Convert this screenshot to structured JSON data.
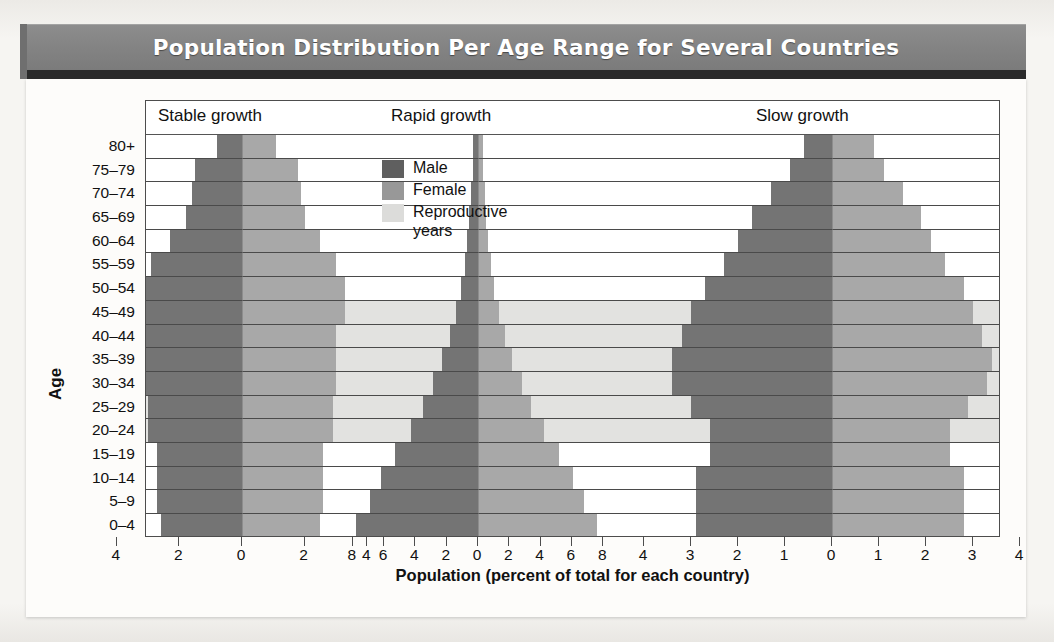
{
  "title": "Population Distribution Per Age Range for Several Countries",
  "axis": {
    "y_title": "Age",
    "x_title": "Population (percent of total for each country)"
  },
  "legend": {
    "items": [
      {
        "key": "male",
        "label": "Male",
        "color": "#5f5f5f"
      },
      {
        "key": "female",
        "label": "Female",
        "color": "#989898"
      },
      {
        "key": "repro",
        "label": "Reproductive\nyears",
        "color": "#dcdcda"
      }
    ]
  },
  "colors": {
    "male": "#747474",
    "female": "#a8a8a8",
    "reproductive_band": "#e2e2e0",
    "title_bar": "#848484",
    "frame": "#4d4d4d"
  },
  "chart_data": {
    "type": "bar",
    "subtype": "population-pyramid",
    "title": "Population Distribution Per Age Range for Several Countries",
    "xlabel": "Population (percent of total for each country)",
    "ylabel": "Age",
    "grid": true,
    "legend_position": "inside-top-left",
    "categories": [
      "0–4",
      "5–9",
      "10–14",
      "15–19",
      "20–24",
      "25–29",
      "30–34",
      "35–39",
      "40–44",
      "45–49",
      "50–54",
      "55–59",
      "60–64",
      "65–69",
      "70–74",
      "75–79",
      "80+"
    ],
    "reproductive_years_rows": [
      "20–24",
      "25–29",
      "30–34",
      "35–39",
      "40–44",
      "45–49"
    ],
    "panels": [
      {
        "name": "Stable growth",
        "xlim": [
          -4,
          4
        ],
        "xticks": [
          4,
          2,
          0,
          2,
          4
        ],
        "xtick_values": [
          -4,
          -2,
          0,
          2,
          4
        ],
        "series": [
          {
            "name": "Male",
            "values": [
              2.6,
              2.7,
              2.7,
              2.7,
              3.0,
              3.0,
              3.1,
              3.1,
              3.1,
              3.4,
              3.4,
              2.9,
              2.3,
              1.8,
              1.6,
              1.5,
              0.8
            ]
          },
          {
            "name": "Female",
            "values": [
              2.5,
              2.6,
              2.6,
              2.6,
              2.9,
              2.9,
              3.0,
              3.0,
              3.0,
              3.3,
              3.3,
              3.0,
              2.5,
              2.0,
              1.9,
              1.8,
              1.1
            ]
          }
        ]
      },
      {
        "name": "Rapid growth",
        "xlim": [
          -8,
          8
        ],
        "xticks": [
          8,
          6,
          4,
          2,
          0,
          2,
          4,
          6,
          8
        ],
        "xtick_values": [
          -8,
          -6,
          -4,
          -2,
          0,
          2,
          4,
          6,
          8
        ],
        "series": [
          {
            "name": "Male",
            "values": [
              7.8,
              6.9,
              6.2,
              5.3,
              4.3,
              3.5,
              2.9,
              2.3,
              1.8,
              1.4,
              1.1,
              0.85,
              0.7,
              0.55,
              0.45,
              0.35,
              0.3
            ]
          },
          {
            "name": "Female",
            "values": [
              7.6,
              6.8,
              6.1,
              5.2,
              4.2,
              3.4,
              2.8,
              2.2,
              1.7,
              1.35,
              1.05,
              0.8,
              0.65,
              0.5,
              0.42,
              0.33,
              0.3
            ]
          }
        ]
      },
      {
        "name": "Slow growth",
        "xlim": [
          -4,
          4
        ],
        "xticks": [
          4,
          3,
          2,
          1,
          0,
          1,
          2,
          3,
          4
        ],
        "xtick_values": [
          -4,
          -3,
          -2,
          -1,
          0,
          1,
          2,
          3,
          4
        ],
        "series": [
          {
            "name": "Male",
            "values": [
              2.9,
              2.9,
              2.9,
              2.6,
              2.6,
              3.0,
              3.4,
              3.4,
              3.2,
              3.0,
              2.7,
              2.3,
              2.0,
              1.7,
              1.3,
              0.9,
              0.6
            ]
          },
          {
            "name": "Female",
            "values": [
              2.8,
              2.8,
              2.8,
              2.5,
              2.5,
              2.9,
              3.3,
              3.4,
              3.2,
              3.0,
              2.8,
              2.4,
              2.1,
              1.9,
              1.5,
              1.1,
              0.9
            ]
          }
        ]
      }
    ]
  },
  "panel_geometry": {
    "plot_width_px": 855,
    "panels": [
      {
        "name": "Stable growth",
        "center_px": 96,
        "px_per_unit": 31.3,
        "caption_left_px": 12
      },
      {
        "name": "Rapid growth",
        "center_px": 332,
        "px_per_unit": 15.65,
        "caption_left_px": 245
      },
      {
        "name": "Slow growth",
        "center_px": 686,
        "px_per_unit": 47.0,
        "caption_left_px": 610
      }
    ]
  }
}
